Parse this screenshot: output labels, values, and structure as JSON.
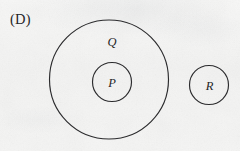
{
  "figure": {
    "choice_label": "(D)",
    "background_color": "#f4f4f3",
    "stroke_color": "#2b2b2d",
    "text_color": "#242426",
    "width": 240,
    "height": 151
  },
  "sets": {
    "outer": {
      "label": "Q",
      "cx": 109,
      "cy": 79.5,
      "r": 59.5
    },
    "inner": {
      "label": "P",
      "cx": 112,
      "cy": 82,
      "r": 19.5
    },
    "separate": {
      "label": "R",
      "cx": 209,
      "cy": 85,
      "r": 19.5
    }
  },
  "relations": {
    "description": "P is a proper subset of Q; R is disjoint from both P and Q"
  }
}
